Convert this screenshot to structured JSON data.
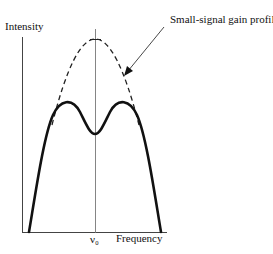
{
  "diagram": {
    "y_axis_label": "Intensity",
    "x_axis_label": "Frequency",
    "center_label": "ν₀",
    "annotation": "Small-signal gain profile",
    "curves": [
      {
        "name": "small-signal-gain-profile",
        "style": "dashed",
        "shape": "parabola",
        "peak_at": "ν0"
      },
      {
        "name": "saturated-gain-profile",
        "style": "solid",
        "shape": "double-humped with dip at ν0"
      }
    ]
  }
}
